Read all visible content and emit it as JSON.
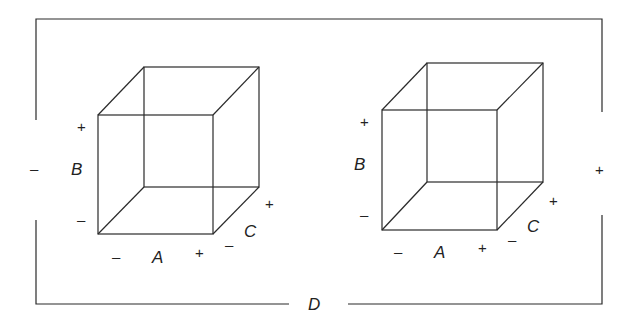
{
  "diagram": {
    "type": "factorial-design-cubes",
    "outer_factor": {
      "label": "D",
      "low": "–",
      "high": "+"
    },
    "cubes": [
      {
        "id": "left",
        "position": "D low",
        "factors": {
          "A": {
            "label": "A",
            "low": "–",
            "high": "+"
          },
          "B": {
            "label": "B",
            "low": "–",
            "high": "+"
          },
          "C": {
            "label": "C",
            "low": "–",
            "high": "+"
          }
        }
      },
      {
        "id": "right",
        "position": "D high",
        "factors": {
          "A": {
            "label": "A",
            "low": "–",
            "high": "+"
          },
          "B": {
            "label": "B",
            "low": "–",
            "high": "+"
          },
          "C": {
            "label": "C",
            "low": "–",
            "high": "+"
          }
        }
      }
    ]
  }
}
